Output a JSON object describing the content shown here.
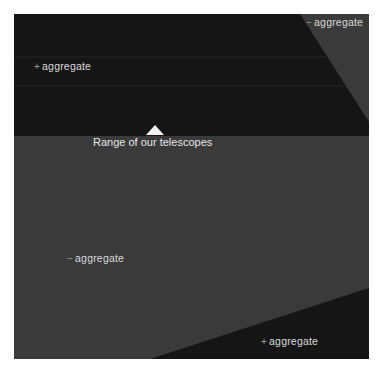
{
  "diagram": {
    "colors": {
      "background": "#ffffff",
      "dark_region": "#151515",
      "gray_region": "#3a3a3a",
      "gridline": "#2a2a2a",
      "marker": "#f2f2f2",
      "label_text": "#d9d9d9"
    },
    "regions": [
      {
        "id": "top-left",
        "label": {
          "sign": "+",
          "text": "aggregate"
        }
      },
      {
        "id": "top-right",
        "label": {
          "sign": "−",
          "text": "aggregate"
        }
      },
      {
        "id": "middle",
        "label": {
          "sign": "−",
          "text": "aggregate"
        }
      },
      {
        "id": "bottom-right",
        "label": {
          "sign": "+",
          "text": "aggregate"
        }
      }
    ],
    "marker": {
      "shape": "triangle-up",
      "caption": "Range of our telescopes"
    }
  }
}
